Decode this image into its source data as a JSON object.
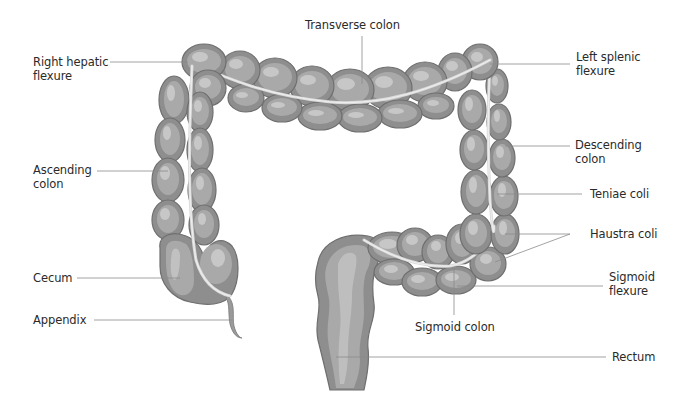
{
  "diagram": {
    "colors": {
      "organ_dark": "#8e8e8e",
      "organ_mid": "#a9a9a9",
      "organ_light": "#c7c7c7",
      "leader_line": "#8c8c8c",
      "text": "#2a2a2a",
      "background": "#ffffff"
    },
    "labels": {
      "transverse_colon": "Transverse colon",
      "right_hepatic_flexure": "Right hepatic\nflexure",
      "left_splenic_flexure": "Left splenic\nflexure",
      "ascending_colon": "Ascending\ncolon",
      "descending_colon": "Descending\ncolon",
      "teniae_coli": "Teniae coli",
      "haustra_coli": "Haustra coli",
      "cecum": "Cecum",
      "sigmoid_flexure": "Sigmoid\nflexure",
      "appendix": "Appendix",
      "sigmoid_colon": "Sigmoid colon",
      "rectum": "Rectum"
    }
  }
}
